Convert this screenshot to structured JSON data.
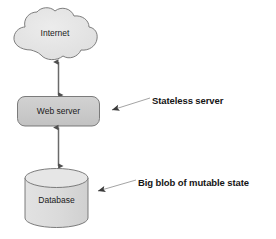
{
  "diagram": {
    "background_color": "#ffffff",
    "nodes": [
      {
        "id": "internet",
        "label": "Internet",
        "shape": "cloud",
        "fill": "#e3e3e3",
        "stroke": "#6f6f6f"
      },
      {
        "id": "web-server",
        "label": "Web server",
        "shape": "rounded-rectangle",
        "fill": "#c9c9c9",
        "stroke": "#6f6f6f"
      },
      {
        "id": "database",
        "label": "Database",
        "shape": "cylinder",
        "fill": "#dcdcdc",
        "stroke": "#6f6f6f"
      }
    ],
    "connectors": [
      {
        "id": "internet-to-web-server",
        "from": "internet",
        "to": "web-server",
        "style": "double-headed-arrow",
        "color": "#5a5a5a"
      },
      {
        "id": "web-server-to-database",
        "from": "web-server",
        "to": "database",
        "style": "double-headed-arrow",
        "color": "#5a5a5a"
      }
    ],
    "callouts": [
      {
        "id": "stateless-server",
        "label": "Stateless server",
        "target": "web-server",
        "color": "#151515",
        "leader_color": "#8a8a8a"
      },
      {
        "id": "big-blob-of-mutable-state",
        "label": "Big blob of mutable state",
        "target": "database",
        "color": "#151515",
        "leader_color": "#8a8a8a"
      }
    ]
  }
}
